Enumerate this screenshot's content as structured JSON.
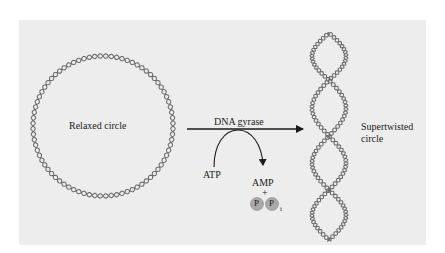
{
  "figure": {
    "relaxed_label": "Relaxed circle",
    "enzyme_label": "DNA gyrase",
    "input_label": "ATP",
    "output_label": "AMP",
    "plus": "+",
    "phosphate_symbol": "P",
    "phosphate_subscript": "i",
    "supertwisted_line1": "Supertwisted",
    "supertwisted_line2": "circle"
  },
  "colors": {
    "panel": "#ededed",
    "strand": "#6e6e6e",
    "arrow": "#1a1a1a",
    "phosphate_fill": "#a9a9a9"
  }
}
